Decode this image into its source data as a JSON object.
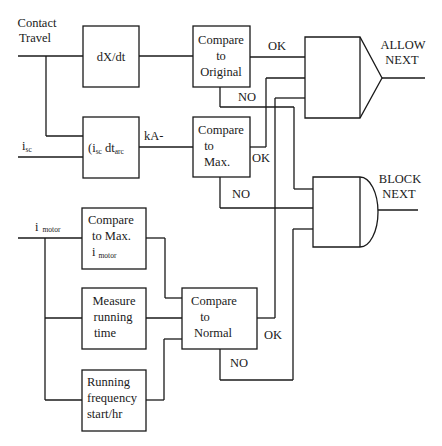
{
  "diagram": {
    "inputs": {
      "contact_travel_line1": "Contact",
      "contact_travel_line2": "Travel",
      "isc_main": "i",
      "isc_sub": "sc",
      "imotor_main": "i",
      "imotor_sub": "motor"
    },
    "blocks": {
      "dxdt": "dX/dt",
      "integral_prefix": "(i",
      "integral_sub1": "sc",
      "integral_mid": " dt",
      "integral_sub2": "arc",
      "compare_original": [
        "Compare",
        "to",
        "Original"
      ],
      "compare_max": [
        "Compare",
        "to",
        "Max."
      ],
      "compare_max_imotor_line1": "Compare",
      "compare_max_imotor_line2": "to Max.",
      "compare_max_imotor_line3_main": "i",
      "compare_max_imotor_line3_sub": "motor",
      "measure_running_time": [
        "Measure",
        "running",
        "time"
      ],
      "running_frequency": [
        "Running",
        "frequency",
        "start/hr"
      ],
      "compare_normal": [
        "Compare",
        "to",
        "Normal"
      ]
    },
    "labels": {
      "ka": "kA-",
      "ok_original": "OK",
      "no_original": "NO",
      "ok_max": "OK",
      "no_max": "NO",
      "ok_normal": "OK",
      "no_normal": "NO"
    },
    "outputs": {
      "allow_line1": "ALLOW",
      "allow_line2": "NEXT",
      "block_line1": "BLOCK",
      "block_line2": "NEXT"
    }
  }
}
